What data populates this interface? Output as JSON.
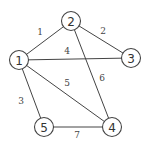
{
  "graph": {
    "nodes": [
      {
        "id": "1",
        "label": "1"
      },
      {
        "id": "2",
        "label": "2"
      },
      {
        "id": "3",
        "label": "3"
      },
      {
        "id": "4",
        "label": "4"
      },
      {
        "id": "5",
        "label": "5"
      }
    ],
    "edges": [
      {
        "from": "1",
        "to": "2",
        "label": "1"
      },
      {
        "from": "2",
        "to": "3",
        "label": "2"
      },
      {
        "from": "1",
        "to": "5",
        "label": "3"
      },
      {
        "from": "1",
        "to": "3",
        "label": "4"
      },
      {
        "from": "1",
        "to": "4",
        "label": "5"
      },
      {
        "from": "2",
        "to": "4",
        "label": "6"
      },
      {
        "from": "5",
        "to": "4",
        "label": "7"
      }
    ]
  }
}
